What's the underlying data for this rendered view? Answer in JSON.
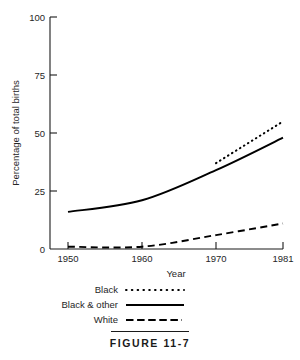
{
  "figure": {
    "caption": "FIGURE 11-7"
  },
  "chart_data": {
    "type": "line",
    "title": "",
    "xlabel": "Year",
    "ylabel": "Percentage of total births",
    "x": [
      1950,
      1960,
      1970,
      1981
    ],
    "xticks": [
      "1950",
      "1960",
      "1970",
      "1981"
    ],
    "yticks": [
      "0",
      "25",
      "50",
      "75",
      "100"
    ],
    "xlim": [
      1950,
      1981
    ],
    "ylim": [
      0,
      100
    ],
    "grid": false,
    "legend_position": "below-plot",
    "series": [
      {
        "name": "Black",
        "style": "dotted",
        "color": "#000000",
        "x": [
          1970,
          1981
        ],
        "values": [
          37,
          55
        ]
      },
      {
        "name": "Black & other",
        "style": "solid",
        "color": "#000000",
        "x": [
          1950,
          1960,
          1970,
          1981
        ],
        "values": [
          16,
          21,
          34,
          48
        ]
      },
      {
        "name": "White",
        "style": "dashed",
        "color": "#000000",
        "x": [
          1950,
          1960,
          1970,
          1981
        ],
        "values": [
          1,
          1,
          6,
          11
        ]
      }
    ]
  },
  "legend": {
    "items": [
      {
        "label": "Black",
        "style": "dotted"
      },
      {
        "label": "Black & other",
        "style": "solid"
      },
      {
        "label": "White",
        "style": "dashed"
      }
    ]
  }
}
